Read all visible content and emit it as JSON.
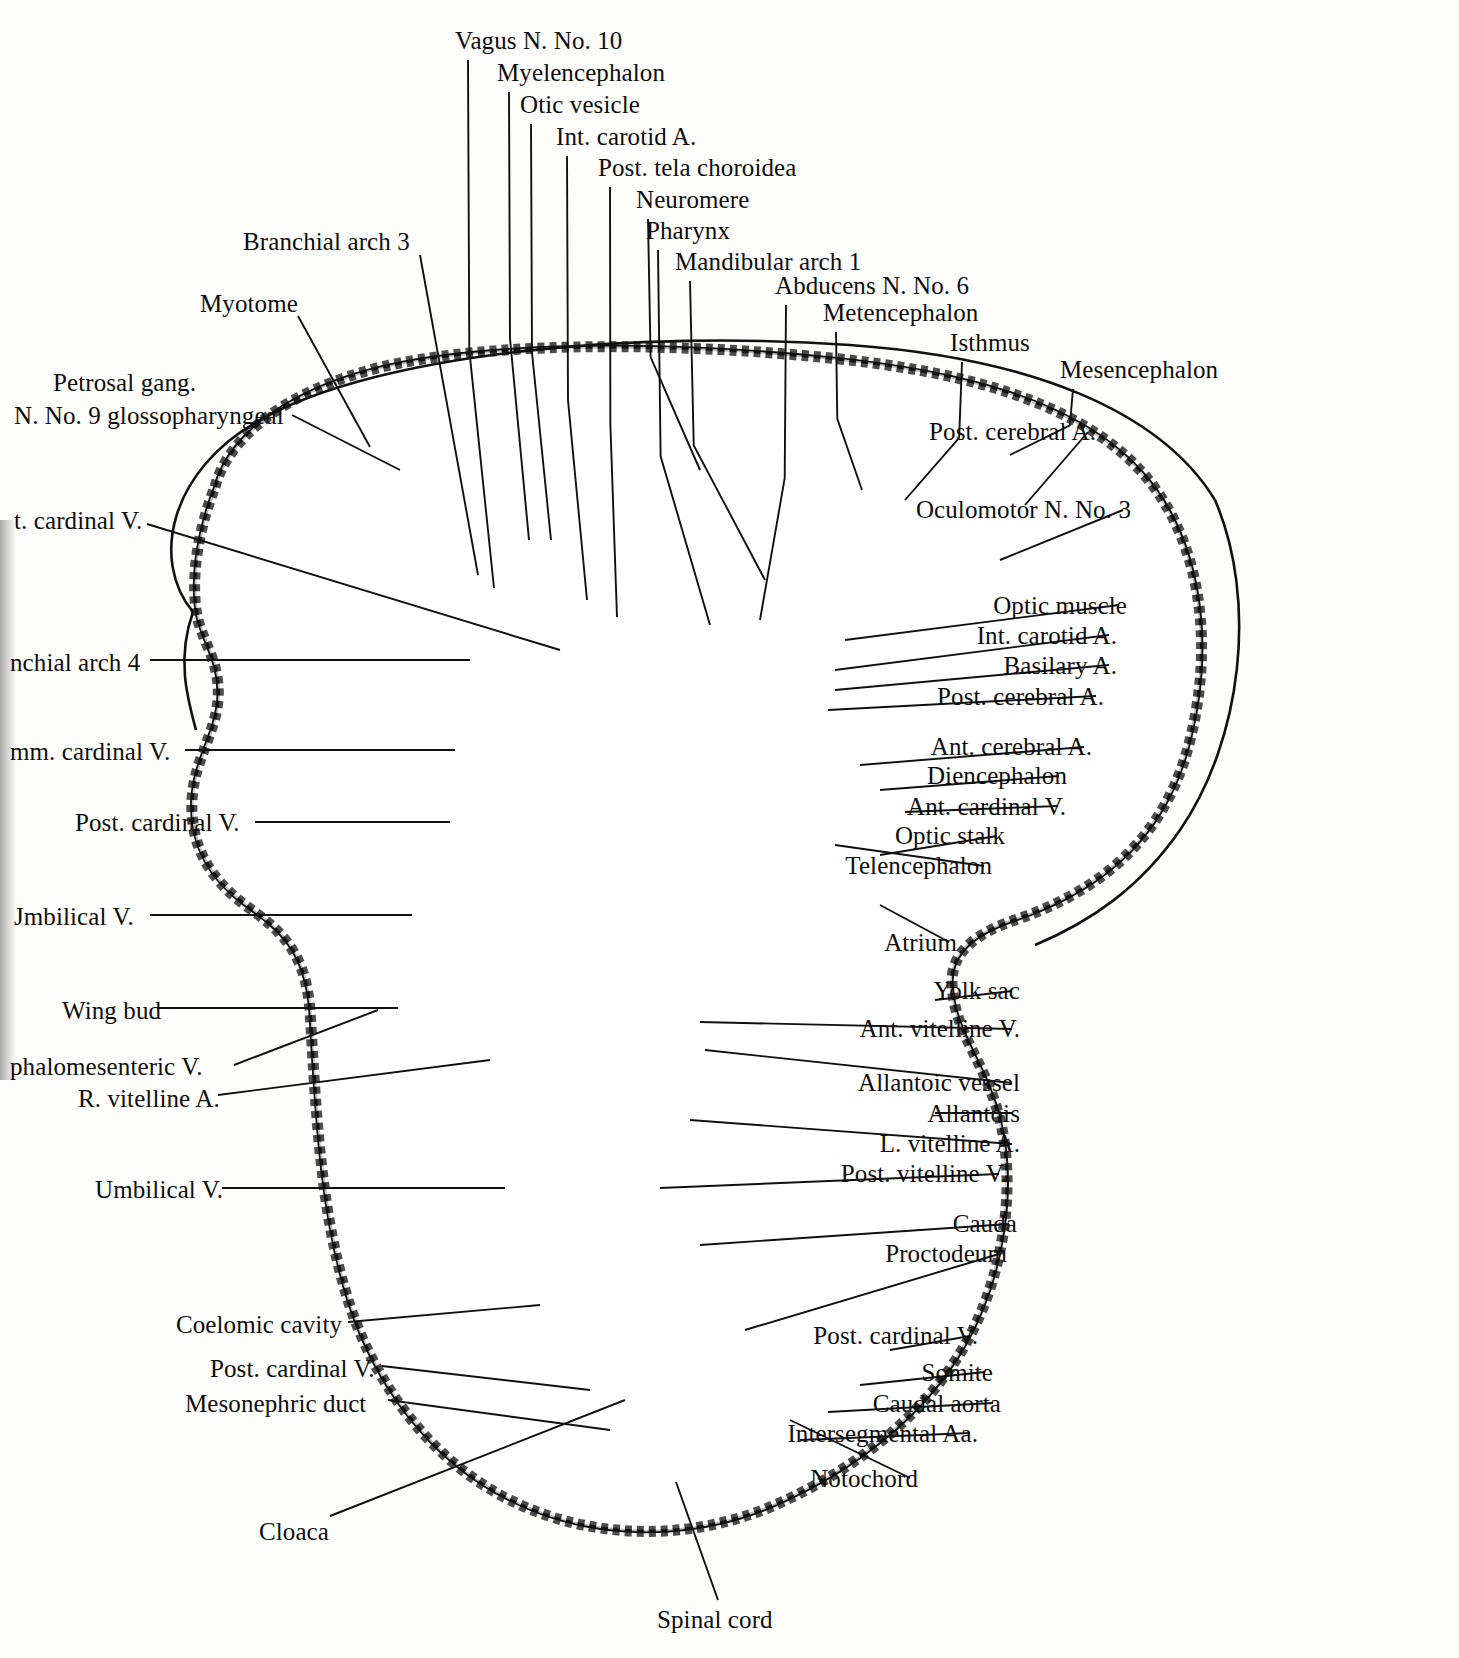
{
  "figure": {
    "paper_color": "#fdfdfb",
    "ink_color": "#101010"
  },
  "labels_top": [
    {
      "text": "Vagus N. No. 10",
      "x": 455,
      "y": 28,
      "lx": 468,
      "ly": 60,
      "tx": 494,
      "ty": 588
    },
    {
      "text": "Myelencephalon",
      "x": 497,
      "y": 60,
      "lx": 509,
      "ly": 92,
      "tx": 529,
      "ty": 540
    },
    {
      "text": "Otic vesicle",
      "x": 520,
      "y": 92,
      "lx": 531,
      "ly": 124,
      "tx": 551,
      "ty": 540
    },
    {
      "text": "Int. carotid A.",
      "x": 556,
      "y": 124,
      "lx": 567,
      "ly": 156,
      "tx": 587,
      "ty": 600
    },
    {
      "text": "Post. tela choroidea",
      "x": 598,
      "y": 155,
      "lx": 610,
      "ly": 187,
      "tx": 617,
      "ty": 617
    },
    {
      "text": "Neuromere",
      "x": 636,
      "y": 187,
      "lx": 648,
      "ly": 219,
      "tx": 700,
      "ty": 470
    },
    {
      "text": "Pharynx",
      "x": 646,
      "y": 218,
      "lx": 658,
      "ly": 250,
      "tx": 710,
      "ty": 625
    },
    {
      "text": "Mandibular arch 1",
      "x": 675,
      "y": 249,
      "lx": 690,
      "ly": 281,
      "tx": 765,
      "ty": 580
    },
    {
      "text": "Abducens N. No. 6",
      "x": 775,
      "y": 273,
      "lx": 786,
      "ly": 305,
      "tx": 760,
      "ty": 620
    },
    {
      "text": "Metencephalon",
      "x": 823,
      "y": 300,
      "lx": 836,
      "ly": 332,
      "tx": 862,
      "ty": 490
    },
    {
      "text": "Isthmus",
      "x": 950,
      "y": 330,
      "lx": 962,
      "ly": 362,
      "tx": 905,
      "ty": 500
    },
    {
      "text": "Mesencephalon",
      "x": 1060,
      "y": 357,
      "lx": 1073,
      "ly": 389,
      "tx": 1010,
      "ty": 455
    }
  ],
  "labels_left": [
    {
      "text": "Branchial arch 3",
      "x": 243,
      "y": 229,
      "lx": 420,
      "ly": 255,
      "tx": 478,
      "ty": 575
    },
    {
      "text": "Myotome",
      "x": 200,
      "y": 291,
      "lx": 298,
      "ly": 316,
      "tx": 370,
      "ty": 447
    },
    {
      "text": "Petrosal gang.",
      "x": 53,
      "y": 370,
      "lx": null,
      "ly": null,
      "tx": null,
      "ty": null
    },
    {
      "text": "N. No. 9 glossopharyngeal",
      "x": 14,
      "y": 403,
      "lx": 292,
      "ly": 415,
      "tx": 400,
      "ty": 470
    },
    {
      "text": "t. cardinal V.",
      "x": 14,
      "y": 508,
      "lx": 147,
      "ly": 524,
      "tx": 560,
      "ty": 650
    },
    {
      "text": "nchial arch 4",
      "x": 10,
      "y": 650,
      "lx": 150,
      "ly": 660,
      "tx": 470,
      "ty": 660
    },
    {
      "text": "mm. cardinal V.",
      "x": 10,
      "y": 739,
      "lx": 185,
      "ly": 750,
      "tx": 455,
      "ty": 750
    },
    {
      "text": "Post. cardinal V.",
      "x": 75,
      "y": 810,
      "lx": 255,
      "ly": 822,
      "tx": 450,
      "ty": 822
    },
    {
      "text": "Jmbilical V.",
      "x": 14,
      "y": 904,
      "lx": 150,
      "ly": 915,
      "tx": 412,
      "ty": 915
    },
    {
      "text": "Wing bud",
      "x": 62,
      "y": 998,
      "lx": 157,
      "ly": 1008,
      "tx": 398,
      "ty": 1008
    },
    {
      "text": "phalomesenteric V.",
      "x": 10,
      "y": 1054,
      "lx": 234,
      "ly": 1065,
      "tx": 378,
      "ty": 1010
    },
    {
      "text": "R. vitelline A.",
      "x": 78,
      "y": 1086,
      "lx": 218,
      "ly": 1095,
      "tx": 490,
      "ty": 1060
    },
    {
      "text": "Umbilical V.",
      "x": 95,
      "y": 1177,
      "lx": 222,
      "ly": 1188,
      "tx": 505,
      "ty": 1188
    },
    {
      "text": "Coelomic cavity",
      "x": 176,
      "y": 1312,
      "lx": 348,
      "ly": 1322,
      "tx": 540,
      "ty": 1305
    },
    {
      "text": "Post. cardinal V.",
      "x": 210,
      "y": 1356,
      "lx": 382,
      "ly": 1366,
      "tx": 590,
      "ty": 1390
    },
    {
      "text": "Mesonephric duct",
      "x": 185,
      "y": 1391,
      "lx": 388,
      "ly": 1400,
      "tx": 610,
      "ty": 1430
    },
    {
      "text": "Cloaca",
      "x": 259,
      "y": 1519,
      "lx": 330,
      "ly": 1516,
      "tx": 625,
      "ty": 1400
    }
  ],
  "labels_right": [
    {
      "text": "Post. cerebral A.",
      "x": 1096,
      "y": 419,
      "lx": 1088,
      "ly": 432,
      "tx": 1025,
      "ty": 505
    },
    {
      "text": "Oculomotor N. No. 3",
      "x": 1131,
      "y": 497,
      "lx": 1123,
      "ly": 510,
      "tx": 1000,
      "ty": 560
    },
    {
      "text": "Optic muscle",
      "x": 1127,
      "y": 593,
      "lx": 1119,
      "ly": 605,
      "tx": 845,
      "ty": 640
    },
    {
      "text": "Int. carotid A.",
      "x": 1117,
      "y": 623,
      "lx": 1109,
      "ly": 635,
      "tx": 835,
      "ty": 670
    },
    {
      "text": "Basilary A.",
      "x": 1117,
      "y": 653,
      "lx": 1109,
      "ly": 665,
      "tx": 835,
      "ty": 690
    },
    {
      "text": "Post. cerebral A.",
      "x": 1104,
      "y": 684,
      "lx": 1096,
      "ly": 696,
      "tx": 828,
      "ty": 710
    },
    {
      "text": "Ant. cerebral A.",
      "x": 1092,
      "y": 734,
      "lx": 1084,
      "ly": 747,
      "tx": 860,
      "ty": 765
    },
    {
      "text": "Diencephalon",
      "x": 1067,
      "y": 763,
      "lx": 1059,
      "ly": 776,
      "tx": 880,
      "ty": 790
    },
    {
      "text": "Ant. cardinal V.",
      "x": 1066,
      "y": 794,
      "lx": 1058,
      "ly": 806,
      "tx": 905,
      "ty": 812
    },
    {
      "text": "Optic stalk",
      "x": 1005,
      "y": 823,
      "lx": 997,
      "ly": 836,
      "tx": 880,
      "ty": 855
    },
    {
      "text": "Telencephalon",
      "x": 992,
      "y": 853,
      "lx": 984,
      "ly": 866,
      "tx": 835,
      "ty": 845
    },
    {
      "text": "Atrium",
      "x": 957,
      "y": 930,
      "lx": 949,
      "ly": 942,
      "tx": 880,
      "ty": 905
    },
    {
      "text": "Yolk sac",
      "x": 1020,
      "y": 978,
      "lx": 1012,
      "ly": 991,
      "tx": 935,
      "ty": 1000
    },
    {
      "text": "Ant. vitelline V.",
      "x": 1020,
      "y": 1016,
      "lx": 1012,
      "ly": 1029,
      "tx": 700,
      "ty": 1022
    },
    {
      "text": "Allantoic vessel",
      "x": 1020,
      "y": 1070,
      "lx": 1012,
      "ly": 1083,
      "tx": 705,
      "ty": 1050
    },
    {
      "text": "Allantois",
      "x": 1020,
      "y": 1101,
      "lx": 1012,
      "ly": 1113,
      "tx": 935,
      "ty": 1113
    },
    {
      "text": "L. vitelline A.",
      "x": 1020,
      "y": 1131,
      "lx": 1012,
      "ly": 1144,
      "tx": 690,
      "ty": 1120
    },
    {
      "text": "Post. vitelline V.",
      "x": 1007,
      "y": 1161,
      "lx": 999,
      "ly": 1174,
      "tx": 660,
      "ty": 1188
    },
    {
      "text": "Cauda",
      "x": 1017,
      "y": 1211,
      "lx": 1009,
      "ly": 1224,
      "tx": 700,
      "ty": 1245
    },
    {
      "text": "Proctodeum",
      "x": 1007,
      "y": 1241,
      "lx": 999,
      "ly": 1254,
      "tx": 745,
      "ty": 1330
    },
    {
      "text": "Post. cardinal V.",
      "x": 978,
      "y": 1323,
      "lx": 970,
      "ly": 1336,
      "tx": 890,
      "ty": 1350
    },
    {
      "text": "Somite",
      "x": 993,
      "y": 1360,
      "lx": 985,
      "ly": 1372,
      "tx": 860,
      "ty": 1385
    },
    {
      "text": "Caudal aorta",
      "x": 1001,
      "y": 1391,
      "lx": 993,
      "ly": 1403,
      "tx": 828,
      "ty": 1412
    },
    {
      "text": "Intersegmental Aa.",
      "x": 978,
      "y": 1421,
      "lx": 970,
      "ly": 1433,
      "tx": 800,
      "ty": 1440
    },
    {
      "text": "Notochord",
      "x": 918,
      "y": 1466,
      "lx": 910,
      "ly": 1478,
      "tx": 790,
      "ty": 1420
    }
  ],
  "labels_bottom": [
    {
      "text": "Spinal cord",
      "x": 657,
      "y": 1607,
      "lx": 718,
      "ly": 1600,
      "tx": 676,
      "ty": 1482
    }
  ]
}
